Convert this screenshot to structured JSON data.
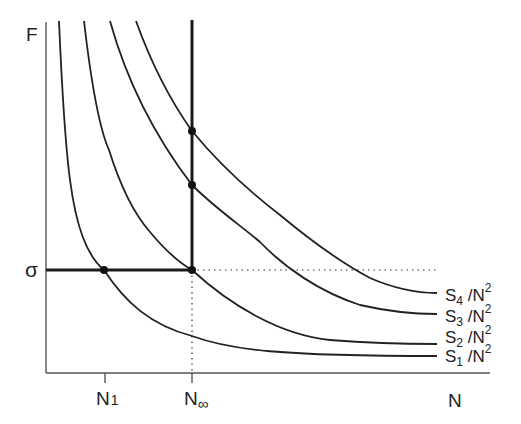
{
  "diagram": {
    "y_axis_label": "F",
    "x_axis_label": "N",
    "sigma_label": "σ",
    "x_ticks": [
      {
        "label": "N",
        "sub": "1"
      },
      {
        "label": "N",
        "sub": "∞"
      }
    ],
    "curves": [
      {
        "name": "S1",
        "label_s": "S",
        "label_sub": "1",
        "label_rest": " /N",
        "label_sup": "2"
      },
      {
        "name": "S2",
        "label_s": "S",
        "label_sub": "2",
        "label_rest": " /N",
        "label_sup": "2"
      },
      {
        "name": "S3",
        "label_s": "S",
        "label_sub": "3",
        "label_rest": " /N",
        "label_sup": "2"
      },
      {
        "name": "S4",
        "label_s": "S",
        "label_sub": "4",
        "label_rest": " /N",
        "label_sup": "2"
      }
    ],
    "points": [
      {
        "name": "S1-sigma-intersection",
        "at": "N1"
      },
      {
        "name": "S2-sigma-intersection",
        "at": "N∞"
      },
      {
        "name": "S3-Ninf-intersection",
        "at": "N∞"
      },
      {
        "name": "S4-Ninf-intersection",
        "at": "N∞"
      }
    ],
    "colors": {
      "line": "#222222",
      "background": "#ffffff"
    }
  }
}
